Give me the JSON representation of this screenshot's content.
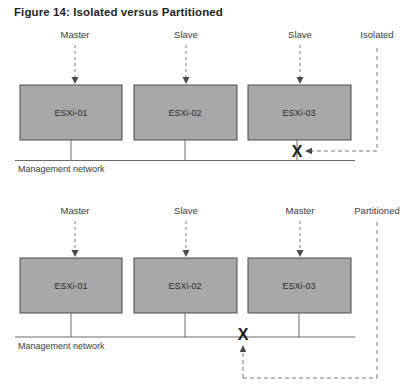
{
  "figure": {
    "title": "Figure 14: Isolated versus Partitioned",
    "colors": {
      "box_fill": "#a8a8a8",
      "box_stroke": "#4a4a4a",
      "line": "#6b6b6b",
      "dashed": "#7a7a7a",
      "text": "#3a3a3a",
      "title_text": "#1f1f1f",
      "x_mark": "#1a1a1a"
    }
  },
  "diagrams": [
    {
      "id": "isolated",
      "state_label": "Isolated",
      "network_label": "Management network",
      "x_mark": "X",
      "hosts": [
        {
          "name": "ESXi-01",
          "role": "Master"
        },
        {
          "name": "ESXi-02",
          "role": "Slave"
        },
        {
          "name": "ESXi-03",
          "role": "Slave"
        }
      ]
    },
    {
      "id": "partitioned",
      "state_label": "Partitioned",
      "network_label": "Management network",
      "x_mark": "X",
      "hosts": [
        {
          "name": "ESXi-01",
          "role": "Master"
        },
        {
          "name": "ESXi-02",
          "role": "Slave"
        },
        {
          "name": "ESXi-03",
          "role": "Master"
        }
      ]
    }
  ]
}
